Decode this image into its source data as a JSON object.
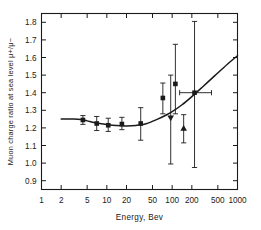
{
  "figure": {
    "name": "muon-charge-ratio-vs-energy",
    "background_color": "#ffffff",
    "ink_color": "#1a1a1a"
  },
  "chart_data": {
    "type": "scatter",
    "title": "",
    "subtitle": "",
    "xlabel": "Energy,  Bev",
    "ylabel": "Muon charge ratio at sea level  μ+/μ−",
    "xscale": "log",
    "yscale": "linear",
    "xlim": [
      1,
      1000
    ],
    "ylim": [
      0.85,
      1.85
    ],
    "grid": false,
    "legend": "none",
    "xticks": [
      1,
      2,
      5,
      10,
      20,
      50,
      100,
      200,
      500,
      1000
    ],
    "xtick_labels": [
      "1",
      "2",
      "5",
      "10",
      "20",
      "50",
      "100",
      "200",
      "500",
      "1000"
    ],
    "yticks": [
      0.9,
      1.0,
      1.1,
      1.2,
      1.3,
      1.4,
      1.5,
      1.6,
      1.7,
      1.8
    ],
    "ytick_labels": [
      "0.9",
      "1.0",
      "1.1",
      "1.2",
      "1.3",
      "1.4",
      "1.5",
      "1.6",
      "1.7",
      "1.8"
    ],
    "series": [
      {
        "name": "measurements",
        "marker": "square",
        "points": [
          {
            "x": 4.3,
            "y": 1.245,
            "yerr_low": 0.025,
            "yerr_high": 0.025,
            "xerr_low": 0,
            "xerr_high": 0,
            "marker": "square"
          },
          {
            "x": 7.0,
            "y": 1.225,
            "yerr_low": 0.04,
            "yerr_high": 0.04,
            "xerr_low": 0,
            "xerr_high": 0,
            "marker": "square"
          },
          {
            "x": 10.5,
            "y": 1.215,
            "yerr_low": 0.035,
            "yerr_high": 0.04,
            "xerr_low": 0,
            "xerr_high": 0,
            "marker": "square"
          },
          {
            "x": 17.0,
            "y": 1.222,
            "yerr_low": 0.032,
            "yerr_high": 0.038,
            "xerr_low": 0,
            "xerr_high": 0,
            "marker": "square"
          },
          {
            "x": 33.0,
            "y": 1.225,
            "yerr_low": 0.095,
            "yerr_high": 0.09,
            "xerr_low": 0,
            "xerr_high": 0,
            "marker": "square"
          },
          {
            "x": 72.0,
            "y": 1.37,
            "yerr_low": 0.09,
            "yerr_high": 0.085,
            "xerr_low": 0,
            "xerr_high": 0,
            "marker": "square"
          },
          {
            "x": 95.0,
            "y": 1.255,
            "yerr_low": 0.26,
            "yerr_high": 0.245,
            "xerr_low": 0,
            "xerr_high": 0,
            "marker": "triangle-down"
          },
          {
            "x": 112.0,
            "y": 1.45,
            "yerr_low": 0.17,
            "yerr_high": 0.225,
            "xerr_low": 0,
            "xerr_high": 0,
            "marker": "square"
          },
          {
            "x": 150.0,
            "y": 1.2,
            "yerr_low": 0.085,
            "yerr_high": 0.075,
            "xerr_low": 0,
            "xerr_high": 0,
            "marker": "triangle-up"
          },
          {
            "x": 220.0,
            "y": 1.4,
            "yerr_low": 0.425,
            "yerr_high": 0.405,
            "xerr_low": 90,
            "xerr_high": 180,
            "marker": "square"
          }
        ]
      }
    ],
    "fit_curve": {
      "name": "theoretical-curve",
      "x": [
        2,
        3,
        4,
        5,
        7,
        10,
        14,
        20,
        28,
        40,
        60,
        80,
        100,
        140,
        200,
        300,
        450,
        700,
        1000
      ],
      "y": [
        1.25,
        1.25,
        1.248,
        1.24,
        1.228,
        1.219,
        1.213,
        1.211,
        1.214,
        1.224,
        1.25,
        1.272,
        1.292,
        1.33,
        1.378,
        1.437,
        1.497,
        1.562,
        1.61
      ]
    }
  }
}
